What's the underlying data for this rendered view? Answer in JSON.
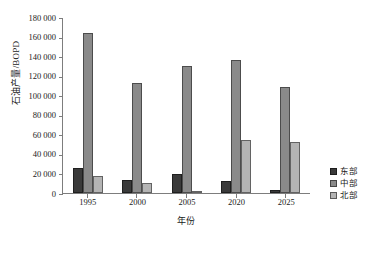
{
  "chart_data": {
    "type": "bar",
    "title": "",
    "xlabel": "年份",
    "ylabel": "石油产量/BOPD",
    "categories": [
      "1995",
      "2000",
      "2005",
      "2020",
      "2025"
    ],
    "series": [
      {
        "name": "东部",
        "color": "#3a3a3a",
        "values": [
          26000,
          13000,
          19000,
          12000,
          3000
        ]
      },
      {
        "name": "中部",
        "color": "#8a8a8a",
        "values": [
          164000,
          113000,
          130000,
          136000,
          108000
        ]
      },
      {
        "name": "北部",
        "color": "#b4b4b4",
        "values": [
          17000,
          10000,
          1000,
          54000,
          52000
        ]
      }
    ],
    "ylim": [
      0,
      180000
    ],
    "ytick_step": 20000,
    "ytick_labels": [
      "180 000",
      "160 000",
      "140 000",
      "120 000",
      "100 000",
      "80 000",
      "60 000",
      "40 000",
      "20 000",
      "0"
    ],
    "ytick_values": [
      180000,
      160000,
      140000,
      120000,
      100000,
      80000,
      60000,
      40000,
      20000,
      0
    ],
    "grid": false,
    "legend_position": "right"
  }
}
